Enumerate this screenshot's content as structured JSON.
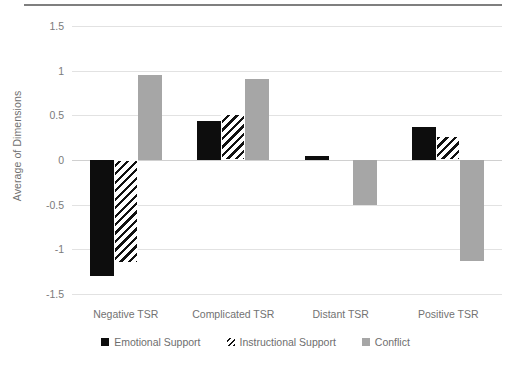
{
  "chart_data": {
    "type": "bar",
    "title": "",
    "xlabel": "",
    "ylabel": "Average of Dimensions",
    "categories": [
      "Negative TSR",
      "Complicated TSR",
      "Distant TSR",
      "Positive TSR"
    ],
    "series": [
      {
        "name": "Emotional Support",
        "color": "#0d0d0d",
        "pattern": "solid",
        "values": [
          -1.3,
          0.44,
          0.05,
          0.37
        ]
      },
      {
        "name": "Instructional Support",
        "color": "#111111",
        "pattern": "hatch",
        "values": [
          -1.15,
          0.52,
          0.0,
          0.27
        ]
      },
      {
        "name": "Conflict",
        "color": "#a6a6a6",
        "pattern": "solid",
        "values": [
          0.95,
          0.91,
          -0.5,
          -1.13
        ]
      }
    ],
    "ylim": [
      -1.5,
      1.5
    ],
    "yticks": [
      "1.5",
      "1",
      "0.5",
      "0",
      "-0.5",
      "-1",
      "-1.5"
    ],
    "ytick_values": [
      1.5,
      1,
      0.5,
      0,
      -0.5,
      -1,
      -1.5
    ],
    "grid": true,
    "legend_position": "bottom"
  },
  "legend": {
    "items": [
      {
        "label": "Emotional Support"
      },
      {
        "label": "Instructional Support"
      },
      {
        "label": "Conflict"
      }
    ]
  }
}
